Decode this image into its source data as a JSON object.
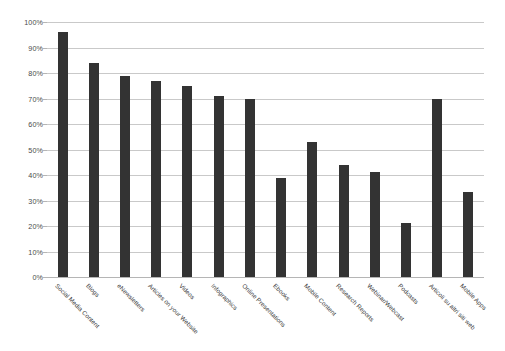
{
  "chart_data": {
    "type": "bar",
    "title": "",
    "subtitle": "",
    "xlabel": "",
    "ylabel": "",
    "ylim": [
      0,
      100
    ],
    "grid": true,
    "legend": "none",
    "y_tick_labels": [
      "0%",
      "10%",
      "20%",
      "30%",
      "40%",
      "50%",
      "60%",
      "70%",
      "80%",
      "90%",
      "100%"
    ],
    "y_tick_values": [
      0,
      10,
      20,
      30,
      40,
      50,
      60,
      70,
      80,
      90,
      100
    ],
    "categories": [
      "Social Media Content",
      "Blogs",
      "eNewsletters",
      "Articles on your Website",
      "Videos",
      "Infographics",
      "Online Presentations",
      "Ebooks",
      "Mobile Content",
      "Research Reports",
      "Webinar/Webcast",
      "Podcasts",
      "Articoli su altri siti web",
      "Mobile Apps"
    ],
    "values": [
      96,
      84,
      79,
      77,
      75,
      71,
      70,
      39,
      53,
      44,
      41,
      21,
      70,
      33.5
    ],
    "bar_color": "#333333",
    "gridline_color": "#c9c9c9",
    "background_color": "#ffffff"
  }
}
